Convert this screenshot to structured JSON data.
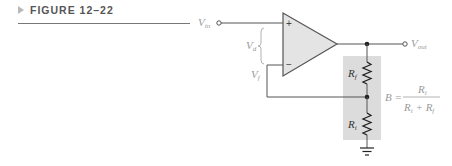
{
  "figure": {
    "label": "FIGURE 12–22"
  },
  "circuit": {
    "input_label": "V",
    "input_sub": "in",
    "output_label": "V",
    "output_sub": "out",
    "diff_label": "V",
    "diff_sub": "d",
    "feedback_label": "V",
    "feedback_sub": "f",
    "plus_sign": "+",
    "minus_sign": "−",
    "rf_label": "R",
    "rf_sub": "f",
    "ri_label": "R",
    "ri_sub": "i",
    "formula": {
      "lhs": "B =",
      "num": "R",
      "num_sub": "i",
      "den_a": "R",
      "den_a_sub": "i",
      "den_plus": " + ",
      "den_b": "R",
      "den_b_sub": "f"
    },
    "colors": {
      "opamp_fill": "#e4e4e4",
      "divider_box": "#dcdcdc",
      "wire": "#555555",
      "label": "#9a9a9a"
    }
  }
}
